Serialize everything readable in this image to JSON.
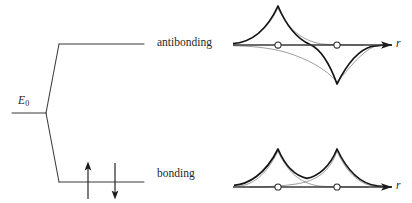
{
  "figure": {
    "title_visible": false,
    "background": "#ffffff",
    "ink": "#262626",
    "width": 412,
    "height": 203
  },
  "energy_diagram": {
    "base_level_label": "E",
    "base_level_subscript": "0",
    "upper_level_label": "antibonding",
    "lower_level_label": "bonding",
    "electrons": [
      {
        "spin": "up",
        "arrow": "↑"
      },
      {
        "spin": "down",
        "arrow": "↓"
      }
    ],
    "geometry": {
      "base_level": {
        "x1": 12,
        "x2": 46,
        "y": 113
      },
      "split_origin": {
        "x": 46,
        "y": 113
      },
      "upper_level": {
        "x1": 59,
        "x2": 144,
        "y": 44
      },
      "lower_level": {
        "x1": 59,
        "x2": 144,
        "y": 182
      },
      "electron_arrows": [
        {
          "x": 88,
          "y_top": 163,
          "y_bottom": 199,
          "direction": "up"
        },
        {
          "x": 115,
          "y_top": 163,
          "y_bottom": 199,
          "direction": "down"
        }
      ]
    }
  },
  "orbital_plots": [
    {
      "name": "antibonding-orbital-plot",
      "axis_label": "r",
      "axis": {
        "x1": 233,
        "x2": 392,
        "y": 45
      },
      "node_count": 1,
      "nuclei": [
        {
          "x": 278,
          "y": 45,
          "marker": "open-circle"
        },
        {
          "x": 337,
          "y": 45,
          "marker": "open-circle"
        }
      ],
      "sum_curve_description": "difference of two 1s orbitals: positive cusp at left nucleus, negative cusp at right nucleus, node midway",
      "component_curve_description": "two faint decaying exponential atomic orbitals, one positive one negative"
    },
    {
      "name": "bonding-orbital-plot",
      "axis_label": "r",
      "axis": {
        "x1": 233,
        "x2": 392,
        "y": 187
      },
      "node_count": 0,
      "nuclei": [
        {
          "x": 278,
          "y": 187,
          "marker": "open-circle"
        },
        {
          "x": 337,
          "y": 187,
          "marker": "open-circle"
        }
      ],
      "sum_curve_description": "sum of two 1s orbitals: two positive cusps with nonzero overlap between nuclei",
      "component_curve_description": "two faint decaying exponential atomic orbitals crossing between the nuclei"
    }
  ]
}
